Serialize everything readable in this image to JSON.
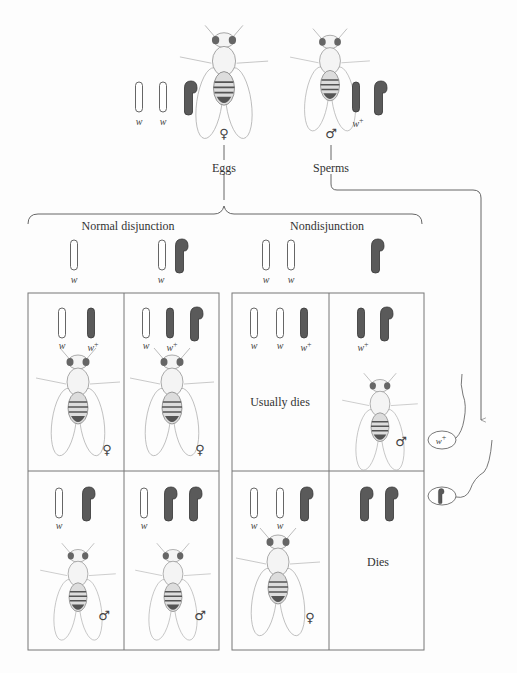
{
  "parents": {
    "female": {
      "symbol": "♀",
      "chromosomes": [
        {
          "type": "X",
          "allele": "w"
        },
        {
          "type": "X",
          "allele": "w"
        },
        {
          "type": "Y",
          "allele": ""
        }
      ]
    },
    "male": {
      "symbol": "♂",
      "chromosomes": [
        {
          "type": "X",
          "allele": "w+"
        },
        {
          "type": "Y",
          "allele": ""
        }
      ]
    }
  },
  "labels": {
    "eggs": "Eggs",
    "sperms": "Sperms",
    "normal_disjunction": "Normal disjunction",
    "nondisjunction": "Nondisjunction",
    "allele_w": "w",
    "allele_w_plus_base": "w",
    "allele_plus": "+"
  },
  "egg_types": [
    {
      "group": "Normal disjunction",
      "chromosomes": [
        "X(w)"
      ]
    },
    {
      "group": "Normal disjunction",
      "chromosomes": [
        "X(w)",
        "Y"
      ]
    },
    {
      "group": "Nondisjunction",
      "chromosomes": [
        "X(w)",
        "X(w)"
      ]
    },
    {
      "group": "Nondisjunction",
      "chromosomes": [
        "Y"
      ]
    }
  ],
  "sperm_types": [
    {
      "label": "w+",
      "chromosome": "X"
    },
    {
      "label": "",
      "chromosome": "Y"
    }
  ],
  "offspring": [
    {
      "row": 1,
      "col": 1,
      "genotype": "X(w) X(w+)",
      "sex": "♀",
      "outcome": ""
    },
    {
      "row": 1,
      "col": 2,
      "genotype": "X(w) X(w+) Y",
      "sex": "♀",
      "outcome": ""
    },
    {
      "row": 1,
      "col": 3,
      "genotype": "X(w) X(w) X(w+)",
      "sex": "",
      "outcome": "Usually dies"
    },
    {
      "row": 1,
      "col": 4,
      "genotype": "X(w+) Y",
      "sex": "♂",
      "outcome": ""
    },
    {
      "row": 2,
      "col": 1,
      "genotype": "X(w) Y",
      "sex": "♂",
      "outcome": ""
    },
    {
      "row": 2,
      "col": 2,
      "genotype": "X(w) Y Y",
      "sex": "♂",
      "outcome": ""
    },
    {
      "row": 2,
      "col": 3,
      "genotype": "X(w) X(w) Y",
      "sex": "♀",
      "outcome": ""
    },
    {
      "row": 2,
      "col": 4,
      "genotype": "Y Y",
      "sex": "",
      "outcome": "Dies"
    }
  ],
  "outcomes": {
    "usually_dies": "Usually dies",
    "dies": "Dies"
  },
  "symbols": {
    "female": "♀",
    "male": "♂"
  },
  "colors": {
    "dark_chromosome": "#5a5a5a",
    "line": "#555555",
    "box": "#777777"
  }
}
